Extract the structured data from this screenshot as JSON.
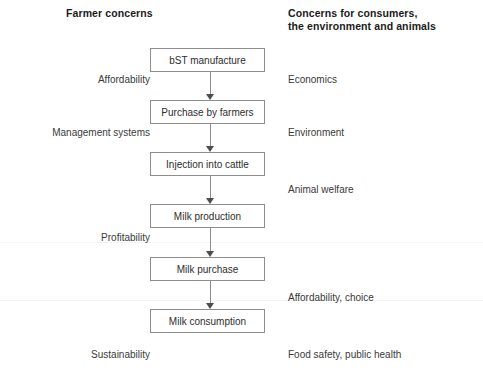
{
  "diagram": {
    "headers": {
      "left": "Farmer concerns",
      "right": "Concerns for consumers,\nthe environment and animals"
    },
    "flow_boxes": [
      {
        "label": "bST manufacture",
        "top": 48
      },
      {
        "label": "Purchase by farmers",
        "top": 100
      },
      {
        "label": "Injection into cattle",
        "top": 152
      },
      {
        "label": "Milk production",
        "top": 204
      },
      {
        "label": "Milk purchase",
        "top": 257
      },
      {
        "label": "Milk consumption",
        "top": 309
      }
    ],
    "left_labels": [
      {
        "text": "Affordability",
        "right": 150,
        "top": 74
      },
      {
        "text": "Management systems",
        "right": 150,
        "top": 127
      },
      {
        "text": "Profitability",
        "right": 150,
        "top": 232
      },
      {
        "text": "Sustainability",
        "right": 150,
        "top": 349
      }
    ],
    "right_labels": [
      {
        "text": "Economics",
        "left": 288,
        "top": 74
      },
      {
        "text": "Environment",
        "left": 288,
        "top": 127
      },
      {
        "text": "Animal welfare",
        "left": 288,
        "top": 184
      },
      {
        "text": "Affordability, choice",
        "left": 288,
        "top": 292
      },
      {
        "text": "Food safety, public health",
        "left": 288,
        "top": 349
      }
    ],
    "colors": {
      "box_border": "#8d8d8d",
      "connector": "#8d8d8d",
      "arrow_head": "#4d4d4d",
      "text": "#2e2e2e",
      "header_text": "#1b1b1b",
      "background": "#ffffff"
    }
  }
}
